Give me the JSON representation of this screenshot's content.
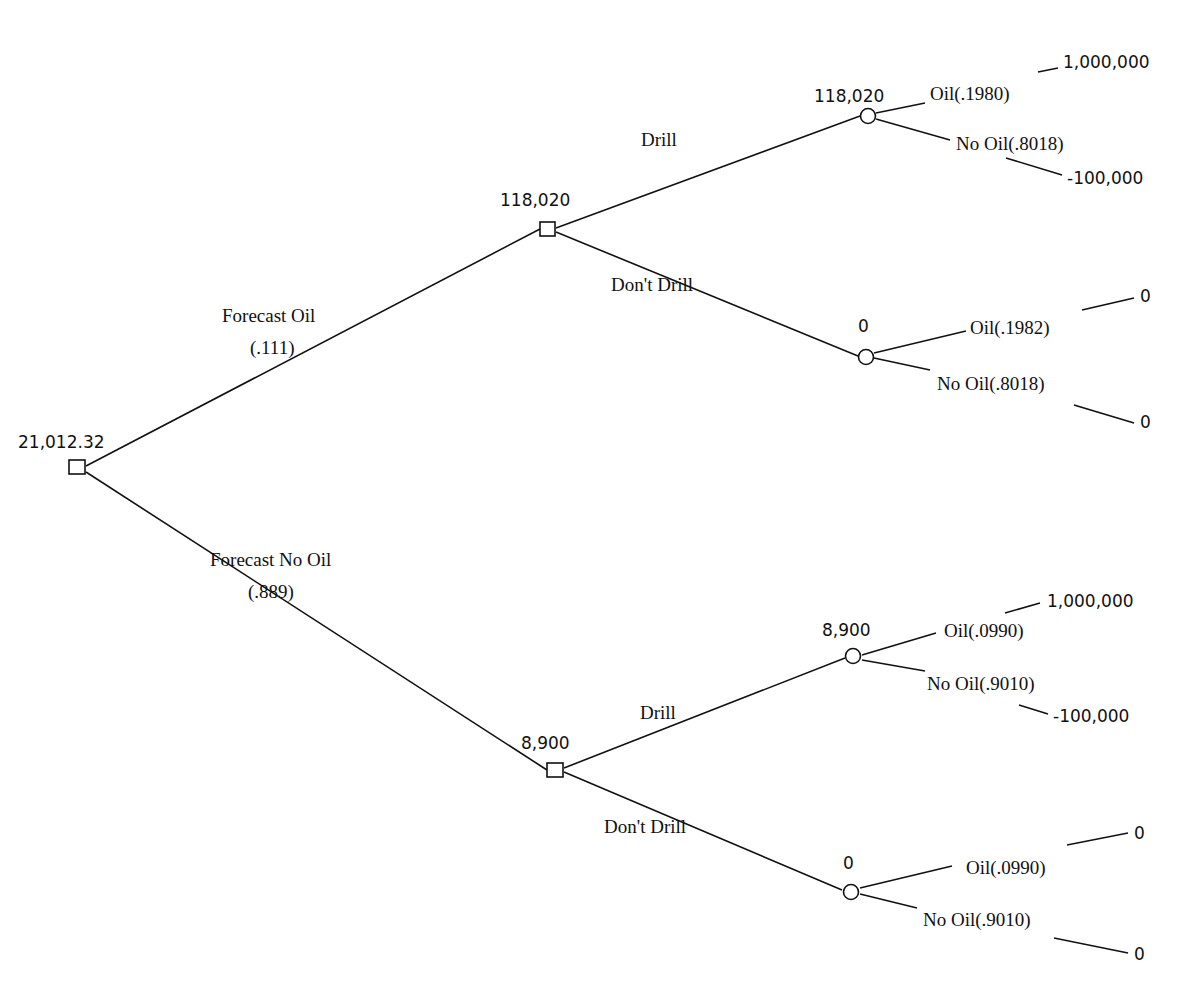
{
  "diagram": {
    "type": "decision-tree",
    "root": {
      "id": "root",
      "kind": "decision",
      "value": "21,012.32"
    },
    "nodes": [
      {
        "id": "d1",
        "kind": "decision",
        "value": "118,020"
      },
      {
        "id": "d2",
        "kind": "decision",
        "value": "8,900"
      },
      {
        "id": "c1",
        "kind": "chance",
        "value": "118,020"
      },
      {
        "id": "c2",
        "kind": "chance",
        "value": "0"
      },
      {
        "id": "c3",
        "kind": "chance",
        "value": "8,900"
      },
      {
        "id": "c4",
        "kind": "chance",
        "value": "0"
      }
    ],
    "branches": [
      {
        "id": "b-forecast-oil",
        "from": "root",
        "to": "d1",
        "label": "Forecast Oil",
        "prob": "(.111)"
      },
      {
        "id": "b-forecast-no-oil",
        "from": "root",
        "to": "d2",
        "label": "Forecast No Oil",
        "prob": "(.889)"
      },
      {
        "id": "b-d1-drill",
        "from": "d1",
        "to": "c1",
        "label": "Drill"
      },
      {
        "id": "b-d1-dont",
        "from": "d1",
        "to": "c2",
        "label": "Don't Drill"
      },
      {
        "id": "b-d2-drill",
        "from": "d2",
        "to": "c3",
        "label": "Drill"
      },
      {
        "id": "b-d2-dont",
        "from": "d2",
        "to": "c4",
        "label": "Don't Drill"
      }
    ],
    "outcomes": [
      {
        "from": "c1",
        "label": "Oil(.1980)",
        "payoff": "1,000,000"
      },
      {
        "from": "c1",
        "label": "No Oil(.8018)",
        "payoff": "-100,000"
      },
      {
        "from": "c2",
        "label": "Oil(.1982)",
        "payoff": "0"
      },
      {
        "from": "c2",
        "label": "No Oil(.8018)",
        "payoff": "0"
      },
      {
        "from": "c3",
        "label": "Oil(.0990)",
        "payoff": "1,000,000"
      },
      {
        "from": "c3",
        "label": "No Oil(.9010)",
        "payoff": "-100,000"
      },
      {
        "from": "c4",
        "label": "Oil(.0990)",
        "payoff": "0"
      },
      {
        "from": "c4",
        "label": "No Oil(.9010)",
        "payoff": "0"
      }
    ]
  }
}
